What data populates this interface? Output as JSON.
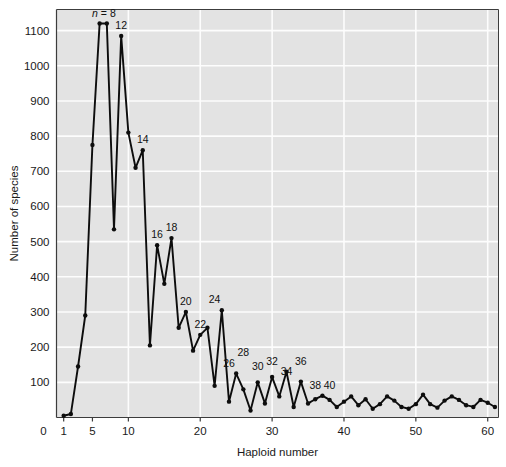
{
  "figure": {
    "background_color": "#ffffff",
    "plot_background_color": "#e3e3e3",
    "gridline_color": "#fdfdfd",
    "series_color": "#0d0d0d",
    "axis_color": "#3c3c3c"
  },
  "chart_data": {
    "type": "line",
    "title": "",
    "subtitle": "",
    "xlabel": "Haploid number",
    "ylabel": "Number of species",
    "xlim": [
      0,
      61.5
    ],
    "ylim": [
      0,
      1160
    ],
    "grid": true,
    "legend": null,
    "legend_position": "none",
    "xticks": [
      0,
      1,
      5,
      10,
      20,
      30,
      40,
      50,
      60
    ],
    "xtick_labels": [
      "0",
      "1",
      "5",
      "10",
      "20",
      "30",
      "40",
      "50",
      "60"
    ],
    "yticks": [
      100,
      200,
      300,
      400,
      500,
      600,
      700,
      800,
      900,
      1000,
      1100
    ],
    "ytick_labels": [
      "100",
      "200",
      "300",
      "400",
      "500",
      "600",
      "700",
      "800",
      "900",
      "1000",
      "1100"
    ],
    "marker": "filled-circle",
    "x": [
      1,
      2,
      3,
      4,
      5,
      6,
      7,
      8,
      9,
      10,
      11,
      12,
      13,
      14,
      15,
      16,
      17,
      18,
      19,
      20,
      21,
      22,
      23,
      24,
      25,
      26,
      27,
      28,
      29,
      30,
      31,
      32,
      33,
      34,
      35,
      36,
      37,
      38,
      39,
      40,
      41,
      42,
      43,
      44,
      45,
      46,
      47,
      48,
      49,
      50,
      51,
      52,
      53,
      54,
      55,
      56,
      57,
      58,
      59,
      60,
      61
    ],
    "values": [
      5,
      10,
      145,
      290,
      775,
      1120,
      1120,
      535,
      1085,
      810,
      710,
      760,
      205,
      490,
      380,
      510,
      255,
      300,
      190,
      235,
      255,
      90,
      305,
      45,
      125,
      80,
      20,
      100,
      40,
      115,
      60,
      130,
      30,
      102,
      40,
      52,
      62,
      50,
      30,
      45,
      60,
      35,
      52,
      25,
      38,
      60,
      48,
      30,
      25,
      38,
      65,
      38,
      28,
      48,
      60,
      50,
      35,
      30,
      50,
      42,
      30
    ],
    "annotations": [
      {
        "label": "n = 8",
        "x": 6.6,
        "y": 1120,
        "italic_prefix": "n"
      },
      {
        "label": "12",
        "x": 9,
        "y": 1085
      },
      {
        "label": "14",
        "x": 12,
        "y": 760
      },
      {
        "label": "16",
        "x": 14,
        "y": 490
      },
      {
        "label": "18",
        "x": 16,
        "y": 510
      },
      {
        "label": "20",
        "x": 18,
        "y": 300
      },
      {
        "label": "22",
        "x": 20,
        "y": 235
      },
      {
        "label": "24",
        "x": 22,
        "y": 305
      },
      {
        "label": "26",
        "x": 24,
        "y": 125
      },
      {
        "label": "28",
        "x": 26,
        "y": 155
      },
      {
        "label": "30",
        "x": 28,
        "y": 115
      },
      {
        "label": "32",
        "x": 30,
        "y": 130
      },
      {
        "label": "34",
        "x": 32,
        "y": 102
      },
      {
        "label": "36",
        "x": 34,
        "y": 130
      },
      {
        "label": "38",
        "x": 36,
        "y": 62
      },
      {
        "label": "40",
        "x": 38,
        "y": 60
      }
    ]
  }
}
